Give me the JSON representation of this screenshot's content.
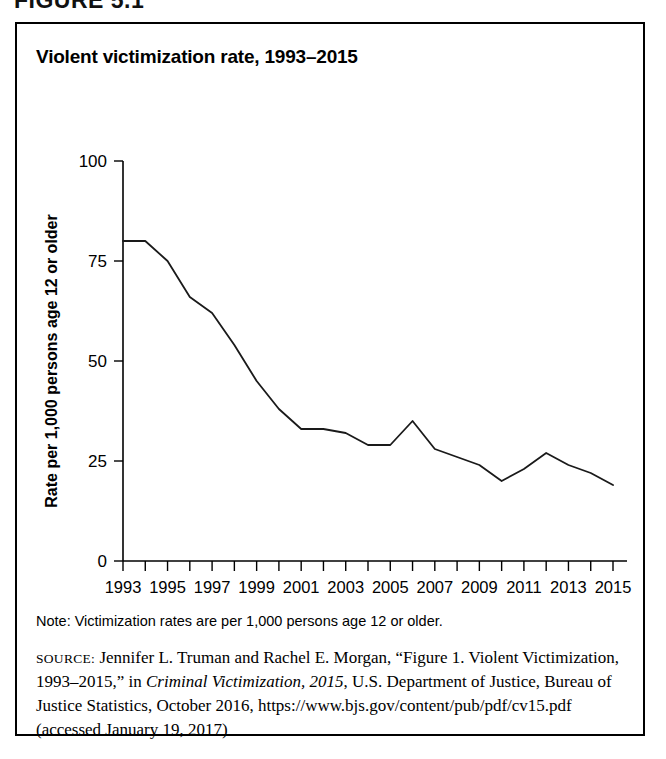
{
  "figure": {
    "label": "FIGURE 5.1"
  },
  "chart_title": "Violent victimization rate, 1993–2015",
  "note": {
    "text": "Note: Victimization rates are per 1,000 persons age 12 or older."
  },
  "source": {
    "label": "source:",
    "part1": " Jennifer L. Truman and Rachel E. Morgan, “Figure 1. Violent Victimization, 1993–2015,” in ",
    "italic": "Criminal Victimization, 2015",
    "part2": ", U.S. Department of Justice, Bureau of Justice Statistics, October 2016, https://www.bjs.gov/content/pub/pdf/cv15.pdf (accessed January 19, 2017)"
  },
  "colors": {
    "line": "#1a1a1a",
    "axis": "#000000",
    "background": "#ffffff",
    "border": "#000000"
  },
  "chart_data": {
    "type": "line",
    "title": "Violent victimization rate, 1993–2015",
    "xlabel": "",
    "ylabel": "Rate per 1,000 persons age 12 or older",
    "xlim": [
      1993,
      2015
    ],
    "ylim": [
      0,
      100
    ],
    "yticks": [
      0,
      25,
      50,
      75,
      100
    ],
    "ytick_labels": [
      "0",
      "25",
      "50",
      "75",
      "100"
    ],
    "xticks": [
      1993,
      1995,
      1997,
      1999,
      2001,
      2003,
      2005,
      2007,
      2009,
      2011,
      2013,
      2015
    ],
    "xtick_labels": [
      "1993",
      "1995",
      "1997",
      "1999",
      "2001",
      "2003",
      "2005",
      "2007",
      "2009",
      "2011",
      "2013",
      "2015"
    ],
    "x_minor_ticks": [
      1994,
      1996,
      1998,
      2000,
      2002,
      2004,
      2006,
      2008,
      2010,
      2012,
      2014
    ],
    "grid": false,
    "legend": false,
    "x": [
      1993,
      1994,
      1995,
      1996,
      1997,
      1998,
      1999,
      2000,
      2001,
      2002,
      2003,
      2004,
      2005,
      2006,
      2007,
      2008,
      2009,
      2010,
      2011,
      2012,
      2013,
      2014,
      2015
    ],
    "values": [
      80,
      80,
      75,
      66,
      62,
      54,
      45,
      38,
      33,
      33,
      32,
      29,
      29,
      35,
      28,
      26,
      24,
      20,
      23,
      27,
      24,
      22,
      19
    ],
    "series": [
      {
        "name": "Violent victimization rate",
        "values": [
          80,
          80,
          75,
          66,
          62,
          54,
          45,
          38,
          33,
          33,
          32,
          29,
          29,
          35,
          28,
          26,
          24,
          20,
          23,
          27,
          24,
          22,
          19
        ]
      }
    ]
  }
}
